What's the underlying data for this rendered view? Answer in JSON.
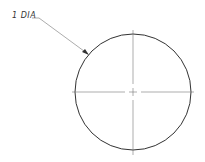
{
  "drawing": {
    "dimension_label": "1 DIA",
    "circle": {
      "cx": 133,
      "cy": 92,
      "r": 58
    },
    "colors": {
      "line": "#333333",
      "centerline": "#777777",
      "leader": "#888888"
    }
  }
}
